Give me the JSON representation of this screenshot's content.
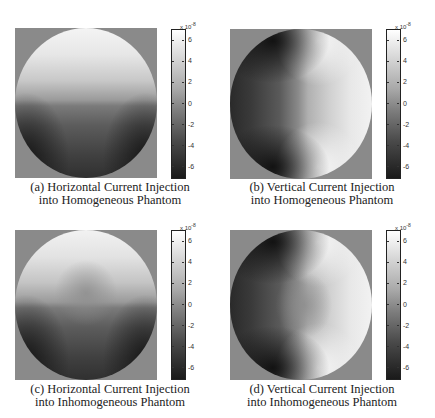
{
  "figure": {
    "panels": [
      {
        "id": "a",
        "caption_line1": "(a) Horizontal Current Injection",
        "caption_line2": "into Homogeneous Phantom",
        "injection": "horizontal",
        "phantom": "homogeneous"
      },
      {
        "id": "b",
        "caption_line1": "(b) Vertical Current Injection",
        "caption_line2": "into Homogeneous Phantom",
        "injection": "vertical",
        "phantom": "homogeneous"
      },
      {
        "id": "c",
        "caption_line1": "(c) Horizontal Current Injection",
        "caption_line2": "into Inhomogeneous Phantom",
        "injection": "horizontal",
        "phantom": "inhomogeneous"
      },
      {
        "id": "d",
        "caption_line1": "(d) Vertical Current Injection",
        "caption_line2": "into Inhomogeneous Phantom",
        "injection": "vertical",
        "phantom": "inhomogeneous"
      }
    ],
    "colorbar": {
      "multiplier_base": "x 10",
      "multiplier_exp": "-8",
      "ticks": [
        "6",
        "4",
        "2",
        "0",
        "-2",
        "-4",
        "-6"
      ],
      "range": [
        -7,
        7
      ],
      "colormap": "gray",
      "background_color": "#8a8a8a"
    }
  },
  "chart_data": [
    {
      "type": "heatmap",
      "title": "(a) Horizontal Current Injection into Homogeneous Phantom",
      "colorbar_label": "x 10^-8",
      "colorbar_ticks": [
        6,
        4,
        2,
        0,
        -2,
        -4,
        -6
      ],
      "vrange": [
        -7e-08,
        7e-08
      ],
      "description": "Circular domain; bright (positive) upper half, dark (negative) lower half with darkest lobes at lower-left and lower-right edges; sharp transition at the horizontal electrodes on left/right mid-height."
    },
    {
      "type": "heatmap",
      "title": "(b) Vertical Current Injection into Homogeneous Phantom",
      "colorbar_label": "x 10^-8",
      "colorbar_ticks": [
        6,
        4,
        2,
        0,
        -2,
        -4,
        -6
      ],
      "vrange": [
        -7e-08,
        7e-08
      ],
      "description": "Circular domain; dark (negative) left half, bright (positive) right half; darkest at upper-left and lower-left; sharp transitions at top and bottom electrodes."
    },
    {
      "type": "heatmap",
      "title": "(c) Horizontal Current Injection into Inhomogeneous Phantom",
      "colorbar_label": "x 10^-8",
      "colorbar_ticks": [
        6,
        4,
        2,
        0,
        -2,
        -4,
        -6
      ],
      "vrange": [
        -7e-08,
        7e-08
      ],
      "description": "Similar to (a) with a mid-gray region in the center indicating an inhomogeneity."
    },
    {
      "type": "heatmap",
      "title": "(d) Vertical Current Injection into Inhomogeneous Phantom",
      "colorbar_label": "x 10^-8",
      "colorbar_ticks": [
        6,
        4,
        2,
        0,
        -2,
        -4,
        -6
      ],
      "vrange": [
        -7e-08,
        7e-08
      ],
      "description": "Similar to (b) with a mid-gray region in the center indicating an inhomogeneity."
    }
  ]
}
